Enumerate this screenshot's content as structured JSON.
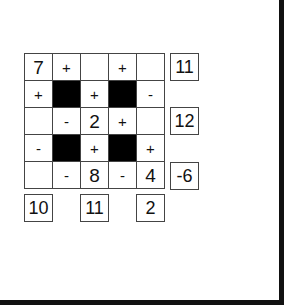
{
  "puzzle": {
    "grid": [
      [
        {
          "type": "number",
          "value": "7"
        },
        {
          "type": "op",
          "value": "+"
        },
        {
          "type": "number",
          "value": ""
        },
        {
          "type": "op",
          "value": "+"
        },
        {
          "type": "number",
          "value": ""
        }
      ],
      [
        {
          "type": "op",
          "value": "+"
        },
        {
          "type": "blocked",
          "value": ""
        },
        {
          "type": "op",
          "value": "+"
        },
        {
          "type": "blocked",
          "value": ""
        },
        {
          "type": "op",
          "value": "-"
        }
      ],
      [
        {
          "type": "number",
          "value": ""
        },
        {
          "type": "op",
          "value": "-"
        },
        {
          "type": "number",
          "value": "2"
        },
        {
          "type": "op",
          "value": "+"
        },
        {
          "type": "number",
          "value": ""
        }
      ],
      [
        {
          "type": "op",
          "value": "-"
        },
        {
          "type": "blocked",
          "value": ""
        },
        {
          "type": "op",
          "value": "+"
        },
        {
          "type": "blocked",
          "value": ""
        },
        {
          "type": "op",
          "value": "+"
        }
      ],
      [
        {
          "type": "number",
          "value": ""
        },
        {
          "type": "op",
          "value": "-"
        },
        {
          "type": "number",
          "value": "8"
        },
        {
          "type": "op",
          "value": "-"
        },
        {
          "type": "number",
          "value": "4"
        }
      ]
    ],
    "row_results": [
      {
        "row": 1,
        "value": "11"
      },
      {
        "row": 3,
        "value": "12"
      },
      {
        "row": 5,
        "value": "-6"
      }
    ],
    "column_results": [
      {
        "column": 1,
        "value": "10"
      },
      {
        "column": 3,
        "value": "11"
      },
      {
        "column": 5,
        "value": "2"
      }
    ]
  }
}
